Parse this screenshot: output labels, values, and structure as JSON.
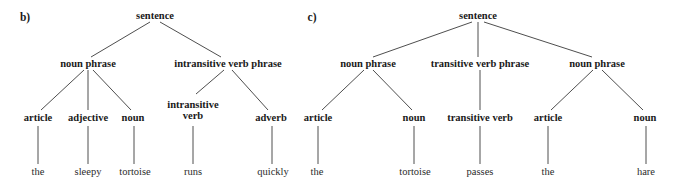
{
  "figure": {
    "background_color": "#ffffff",
    "line_color": "#3a3a3a",
    "text_color": "#1a1a1a"
  },
  "panels": [
    {
      "tag": "b)",
      "tag_x": 25,
      "tag_y": 17,
      "sentence": "the sleepy tortoise runs quickly",
      "nodes": [
        {
          "id": "b-root",
          "label": "sentence",
          "x": 155,
          "y": 16,
          "level": "root"
        },
        {
          "id": "b-np",
          "label": "noun phrase",
          "x": 88,
          "y": 64,
          "level": "phrase"
        },
        {
          "id": "b-ivp",
          "label": "intransitive verb phrase",
          "x": 228,
          "y": 64,
          "level": "phrase"
        },
        {
          "id": "b-art",
          "label": "article",
          "x": 38,
          "y": 118,
          "level": "pos"
        },
        {
          "id": "b-adj",
          "label": "adjective",
          "x": 88,
          "y": 118,
          "level": "pos"
        },
        {
          "id": "b-noun",
          "label": "noun",
          "x": 133,
          "y": 118,
          "level": "pos"
        },
        {
          "id": "b-iverb",
          "label": "intransitive\nverb",
          "x": 193,
          "y": 110,
          "level": "pos"
        },
        {
          "id": "b-adv",
          "label": "adverb",
          "x": 271,
          "y": 118,
          "level": "pos"
        },
        {
          "id": "b-w1",
          "label": "the",
          "x": 38,
          "y": 172,
          "level": "leaf"
        },
        {
          "id": "b-w2",
          "label": "sleepy",
          "x": 88,
          "y": 172,
          "level": "leaf"
        },
        {
          "id": "b-w3",
          "label": "tortoise",
          "x": 135,
          "y": 172,
          "level": "leaf"
        },
        {
          "id": "b-w4",
          "label": "runs",
          "x": 193,
          "y": 172,
          "level": "leaf"
        },
        {
          "id": "b-w5",
          "label": "quickly",
          "x": 273,
          "y": 172,
          "level": "leaf"
        }
      ],
      "edges": [
        {
          "from": "b-root",
          "to": "b-np",
          "x1": 150,
          "y1": 22,
          "x2": 91,
          "y2": 57
        },
        {
          "from": "b-root",
          "to": "b-ivp",
          "x1": 160,
          "y1": 22,
          "x2": 221,
          "y2": 57
        },
        {
          "from": "b-np",
          "to": "b-art",
          "x1": 84,
          "y1": 70,
          "x2": 41,
          "y2": 110
        },
        {
          "from": "b-np",
          "to": "b-adj",
          "x1": 88,
          "y1": 70,
          "x2": 88,
          "y2": 110
        },
        {
          "from": "b-np",
          "to": "b-noun",
          "x1": 93,
          "y1": 70,
          "x2": 131,
          "y2": 110
        },
        {
          "from": "b-ivp",
          "to": "b-iverb",
          "x1": 224,
          "y1": 70,
          "x2": 196,
          "y2": 94
        },
        {
          "from": "b-ivp",
          "to": "b-adv",
          "x1": 232,
          "y1": 70,
          "x2": 268,
          "y2": 110
        },
        {
          "from": "b-art",
          "to": "b-w1",
          "x1": 38,
          "y1": 126,
          "x2": 38,
          "y2": 164
        },
        {
          "from": "b-adj",
          "to": "b-w2",
          "x1": 88,
          "y1": 126,
          "x2": 88,
          "y2": 164
        },
        {
          "from": "b-noun",
          "to": "b-w3",
          "x1": 134,
          "y1": 126,
          "x2": 134,
          "y2": 164
        },
        {
          "from": "b-iverb",
          "to": "b-w4",
          "x1": 193,
          "y1": 126,
          "x2": 193,
          "y2": 164
        },
        {
          "from": "b-adv",
          "to": "b-w5",
          "x1": 272,
          "y1": 126,
          "x2": 272,
          "y2": 164
        }
      ]
    },
    {
      "tag": "c)",
      "tag_x": 312,
      "tag_y": 17,
      "sentence": "the tortoise passes the hare",
      "nodes": [
        {
          "id": "c-root",
          "label": "sentence",
          "x": 478,
          "y": 16,
          "level": "root"
        },
        {
          "id": "c-np1",
          "label": "noun phrase",
          "x": 368,
          "y": 64,
          "level": "phrase"
        },
        {
          "id": "c-tvp",
          "label": "transitive verb phrase",
          "x": 480,
          "y": 64,
          "level": "phrase"
        },
        {
          "id": "c-np2",
          "label": "noun phrase",
          "x": 597,
          "y": 64,
          "level": "phrase"
        },
        {
          "id": "c-art1",
          "label": "article",
          "x": 318,
          "y": 118,
          "level": "pos"
        },
        {
          "id": "c-noun1",
          "label": "noun",
          "x": 414,
          "y": 118,
          "level": "pos"
        },
        {
          "id": "c-tverb",
          "label": "transitive verb",
          "x": 480,
          "y": 118,
          "level": "pos"
        },
        {
          "id": "c-art2",
          "label": "article",
          "x": 548,
          "y": 118,
          "level": "pos"
        },
        {
          "id": "c-noun2",
          "label": "noun",
          "x": 645,
          "y": 118,
          "level": "pos"
        },
        {
          "id": "c-w1",
          "label": "the",
          "x": 317,
          "y": 172,
          "level": "leaf"
        },
        {
          "id": "c-w2",
          "label": "tortoise",
          "x": 415,
          "y": 172,
          "level": "leaf"
        },
        {
          "id": "c-w3",
          "label": "passes",
          "x": 480,
          "y": 172,
          "level": "leaf"
        },
        {
          "id": "c-w4",
          "label": "the",
          "x": 548,
          "y": 172,
          "level": "leaf"
        },
        {
          "id": "c-w5",
          "label": "hare",
          "x": 646,
          "y": 172,
          "level": "leaf"
        }
      ],
      "edges": [
        {
          "from": "c-root",
          "to": "c-np1",
          "x1": 472,
          "y1": 22,
          "x2": 373,
          "y2": 57
        },
        {
          "from": "c-root",
          "to": "c-tvp",
          "x1": 478,
          "y1": 22,
          "x2": 478,
          "y2": 57
        },
        {
          "from": "c-root",
          "to": "c-np2",
          "x1": 484,
          "y1": 22,
          "x2": 592,
          "y2": 57
        },
        {
          "from": "c-np1",
          "to": "c-art1",
          "x1": 364,
          "y1": 70,
          "x2": 322,
          "y2": 110
        },
        {
          "from": "c-np1",
          "to": "c-noun1",
          "x1": 373,
          "y1": 70,
          "x2": 412,
          "y2": 110
        },
        {
          "from": "c-tvp",
          "to": "c-tverb",
          "x1": 480,
          "y1": 70,
          "x2": 480,
          "y2": 110
        },
        {
          "from": "c-np2",
          "to": "c-art2",
          "x1": 593,
          "y1": 70,
          "x2": 551,
          "y2": 110
        },
        {
          "from": "c-np2",
          "to": "c-noun2",
          "x1": 602,
          "y1": 70,
          "x2": 643,
          "y2": 110
        },
        {
          "from": "c-art1",
          "to": "c-w1",
          "x1": 318,
          "y1": 126,
          "x2": 318,
          "y2": 164
        },
        {
          "from": "c-noun1",
          "to": "c-w2",
          "x1": 414,
          "y1": 126,
          "x2": 414,
          "y2": 164
        },
        {
          "from": "c-tverb",
          "to": "c-w3",
          "x1": 480,
          "y1": 126,
          "x2": 480,
          "y2": 164
        },
        {
          "from": "c-art2",
          "to": "c-w4",
          "x1": 548,
          "y1": 126,
          "x2": 548,
          "y2": 164
        },
        {
          "from": "c-noun2",
          "to": "c-w5",
          "x1": 646,
          "y1": 126,
          "x2": 646,
          "y2": 164
        }
      ]
    }
  ]
}
